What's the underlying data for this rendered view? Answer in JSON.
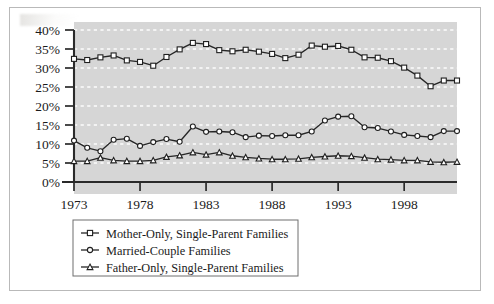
{
  "figure": {
    "background_color": "#ffffff",
    "frame_border_color": "#b9b9b9",
    "plot_background_color": "#d6d6d6",
    "gridline_color": "#fdfdfd",
    "axis_color": "#2a2a2a",
    "series_color": "#262626",
    "marker_fill_color": "#ffffff"
  },
  "chart_data": {
    "type": "line",
    "title": "",
    "subtitle": "",
    "xlabel": "",
    "ylabel": "",
    "xlim": [
      1973,
      2002
    ],
    "ylim": [
      0,
      40
    ],
    "grid": true,
    "grid_axis": "y",
    "legend_position": "below-left",
    "x": [
      1973,
      1974,
      1975,
      1976,
      1977,
      1978,
      1979,
      1980,
      1981,
      1982,
      1983,
      1984,
      1985,
      1986,
      1987,
      1988,
      1989,
      1990,
      1991,
      1992,
      1993,
      1994,
      1995,
      1996,
      1997,
      1998,
      1999,
      2000,
      2001,
      2002
    ],
    "x_tick_labels": [
      "1973",
      "1978",
      "1983",
      "1988",
      "1993",
      "1998"
    ],
    "x_tick_values": [
      1973,
      1978,
      1983,
      1988,
      1993,
      1998
    ],
    "y_tick_labels": [
      "0%",
      "5%",
      "10%",
      "15%",
      "20%",
      "25%",
      "30%",
      "35%",
      "40%"
    ],
    "y_tick_values": [
      0,
      5,
      10,
      15,
      20,
      25,
      30,
      35,
      40
    ],
    "series": [
      {
        "name": "Mother-Only, Single-Parent Families",
        "marker": "square",
        "values": [
          32.4,
          32.1,
          32.8,
          33.3,
          32.0,
          31.6,
          30.6,
          32.9,
          34.9,
          36.6,
          36.3,
          34.7,
          34.4,
          34.8,
          34.3,
          33.7,
          32.6,
          33.5,
          35.9,
          35.6,
          35.8,
          34.8,
          32.8,
          32.7,
          31.8,
          30.1,
          28.0,
          25.2,
          26.7,
          26.7
        ]
      },
      {
        "name": "Married-Couple Families",
        "marker": "circle",
        "values": [
          10.9,
          9.0,
          8.1,
          11.1,
          11.4,
          9.5,
          10.5,
          11.3,
          10.6,
          14.6,
          13.2,
          13.3,
          13.1,
          11.8,
          12.2,
          12.1,
          12.3,
          12.3,
          13.3,
          16.2,
          17.2,
          17.3,
          14.4,
          14.2,
          13.3,
          12.4,
          12.1,
          11.8,
          13.4,
          13.4
        ]
      },
      {
        "name": "Father-Only, Single-Parent Families",
        "marker": "triangle",
        "values": [
          5.5,
          5.5,
          6.4,
          5.7,
          5.5,
          5.5,
          5.7,
          6.6,
          7.0,
          7.8,
          7.2,
          7.8,
          6.9,
          6.5,
          6.2,
          6.0,
          6.0,
          6.1,
          6.5,
          6.7,
          6.9,
          6.8,
          6.4,
          6.0,
          5.9,
          5.7,
          5.7,
          5.3,
          5.2,
          5.3
        ]
      }
    ],
    "legend_entries": [
      "Mother-Only, Single-Parent Families",
      "Married-Couple Families",
      "Father-Only, Single-Parent Families"
    ]
  }
}
